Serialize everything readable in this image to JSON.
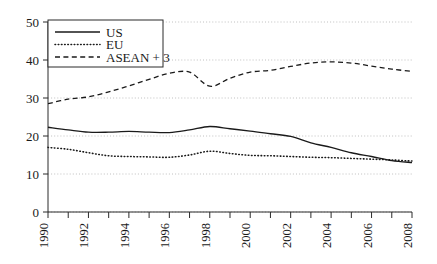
{
  "chart_data": {
    "type": "line",
    "title": "",
    "xlabel": "",
    "ylabel": "",
    "xlim": [
      1990,
      2008
    ],
    "ylim": [
      0,
      50
    ],
    "grid": true,
    "legend_position": "top-left",
    "x": [
      1990,
      1991,
      1992,
      1993,
      1994,
      1995,
      1996,
      1997,
      1998,
      1999,
      2000,
      2001,
      2002,
      2003,
      2004,
      2005,
      2006,
      2007,
      2008
    ],
    "xtick_labels": [
      "1990",
      "1992",
      "1994",
      "1996",
      "1998",
      "2000",
      "2002",
      "2004",
      "2006",
      "2008"
    ],
    "xtick_values": [
      1990,
      1992,
      1994,
      1996,
      1998,
      2000,
      2002,
      2004,
      2006,
      2008
    ],
    "ytick_labels": [
      "0",
      "10",
      "20",
      "30",
      "40",
      "50"
    ],
    "ytick_values": [
      0,
      10,
      20,
      30,
      40,
      50
    ],
    "series": [
      {
        "name": "US",
        "style": "solid",
        "values": [
          22.3,
          21.6,
          21.0,
          21.0,
          21.2,
          21.0,
          20.9,
          21.6,
          22.5,
          21.9,
          21.3,
          20.6,
          19.9,
          18.2,
          17.0,
          15.6,
          14.6,
          13.5,
          13.0
        ]
      },
      {
        "name": "EU",
        "style": "dotted",
        "values": [
          17.0,
          16.5,
          15.6,
          14.8,
          14.6,
          14.5,
          14.4,
          15.0,
          16.0,
          15.4,
          14.9,
          14.8,
          14.6,
          14.4,
          14.3,
          14.1,
          13.9,
          13.7,
          13.4
        ]
      },
      {
        "name": "ASEAN + 3",
        "style": "dashed",
        "values": [
          28.5,
          29.7,
          30.3,
          31.6,
          33.2,
          34.9,
          36.5,
          36.8,
          33.1,
          35.2,
          36.8,
          37.3,
          38.3,
          39.2,
          39.5,
          39.2,
          38.4,
          37.6,
          37.0
        ]
      }
    ]
  },
  "legend": {
    "entries": [
      {
        "label": "US"
      },
      {
        "label": "EU"
      },
      {
        "label": "ASEAN + 3"
      }
    ]
  },
  "colors": {
    "ink": "#1a1a1a",
    "grid": "#b9b9b9",
    "background": "#ffffff"
  }
}
